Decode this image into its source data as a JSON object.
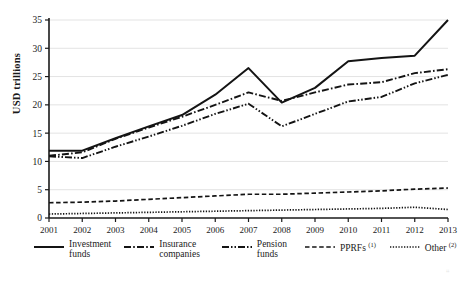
{
  "chart_data": {
    "type": "line",
    "title": "",
    "xlabel": "",
    "ylabel": "USD trillions",
    "categories": [
      "2001",
      "2002",
      "2003",
      "2004",
      "2005",
      "2006",
      "2007",
      "2008",
      "2009",
      "2010",
      "2011",
      "2012",
      "2013"
    ],
    "x": [
      2001,
      2002,
      2003,
      2004,
      2005,
      2006,
      2007,
      2008,
      2009,
      2010,
      2011,
      2012,
      2013
    ],
    "ylim": [
      0,
      35
    ],
    "yticks": [
      0,
      5,
      10,
      15,
      20,
      25,
      30,
      35
    ],
    "grid": "horizontal",
    "legend_position": "bottom",
    "series": [
      {
        "name": "Investment funds",
        "style": "solid",
        "values": [
          11.9,
          11.9,
          14.1,
          16.2,
          18.2,
          21.8,
          26.5,
          20.4,
          23.0,
          27.7,
          28.3,
          28.7,
          35.0
        ]
      },
      {
        "name": "Insurance companies",
        "style": "dash-dot",
        "values": [
          11.0,
          11.6,
          14.0,
          16.0,
          17.9,
          20.0,
          22.2,
          20.7,
          22.2,
          23.6,
          24.0,
          25.6,
          26.3
        ]
      },
      {
        "name": "Pension funds",
        "style": "dash-dot-dot",
        "values": [
          10.9,
          10.6,
          12.6,
          14.4,
          16.3,
          18.4,
          20.2,
          16.2,
          18.4,
          20.6,
          21.4,
          23.8,
          25.3
        ]
      },
      {
        "name": "PPRFs",
        "style": "dashed",
        "footnote": "1",
        "values": [
          2.7,
          2.8,
          3.0,
          3.3,
          3.6,
          3.9,
          4.2,
          4.2,
          4.4,
          4.6,
          4.8,
          5.1,
          5.3
        ]
      },
      {
        "name": "Other",
        "style": "dotted",
        "footnote": "2",
        "values": [
          0.7,
          0.8,
          0.9,
          1.0,
          1.1,
          1.2,
          1.3,
          1.4,
          1.5,
          1.6,
          1.7,
          1.9,
          1.5
        ]
      }
    ],
    "axis_color": "#1a1a1a",
    "grid_color": "#e3e3e3",
    "line_color": "#141414"
  },
  "legend": {
    "items": [
      {
        "label": "Investment\nfunds",
        "swatch": "solid-line-swatch",
        "footnote": ""
      },
      {
        "label": "Insurance\ncompanies",
        "swatch": "dash-dot-line-swatch",
        "footnote": ""
      },
      {
        "label": "Pension\nfunds",
        "swatch": "dash-dot-dot-line-swatch",
        "footnote": ""
      },
      {
        "label": "PPRFs ",
        "swatch": "dashed-line-swatch",
        "footnote": "(1)"
      },
      {
        "label": "Other ",
        "swatch": "dotted-line-swatch",
        "footnote": "(2)"
      }
    ]
  },
  "axis": {
    "ylabel": "USD trillions"
  }
}
